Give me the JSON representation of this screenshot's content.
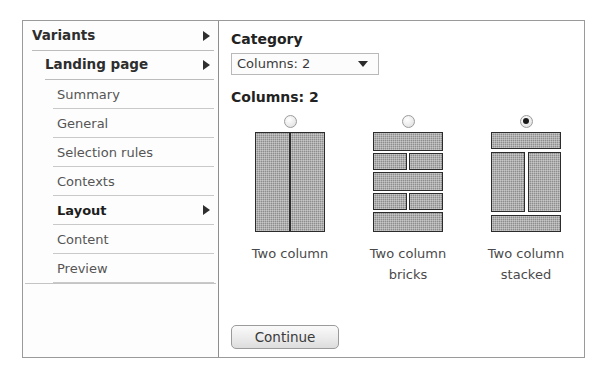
{
  "sidebar": {
    "items": [
      {
        "label": "Variants",
        "level": 0,
        "bold": true,
        "arrow": true,
        "selected": false
      },
      {
        "label": "Landing page",
        "level": 1,
        "bold": true,
        "arrow": true,
        "selected": false
      },
      {
        "label": "Summary",
        "level": 2,
        "bold": false,
        "arrow": false,
        "selected": false
      },
      {
        "label": "General",
        "level": 2,
        "bold": false,
        "arrow": false,
        "selected": false
      },
      {
        "label": "Selection rules",
        "level": 2,
        "bold": false,
        "arrow": false,
        "selected": false
      },
      {
        "label": "Contexts",
        "level": 2,
        "bold": false,
        "arrow": false,
        "selected": false
      },
      {
        "label": "Layout",
        "level": 2,
        "bold": true,
        "arrow": true,
        "selected": true
      },
      {
        "label": "Content",
        "level": 2,
        "bold": false,
        "arrow": false,
        "selected": false
      },
      {
        "label": "Preview",
        "level": 2,
        "bold": false,
        "arrow": false,
        "selected": false
      }
    ]
  },
  "content": {
    "category_title": "Category",
    "category_select": {
      "value": "Columns: 2",
      "arrow_icon": "chevron-down-icon"
    },
    "group_title": "Columns: 2",
    "options": [
      {
        "label": "Two column",
        "thumbnail": "two-column",
        "selected": false
      },
      {
        "label": "Two column bricks",
        "thumbnail": "two-column-bricks",
        "selected": false
      },
      {
        "label": "Two column stacked",
        "thumbnail": "two-column-stacked",
        "selected": true
      }
    ],
    "continue_label": "Continue"
  },
  "colors": {
    "frame_border": "#9a9a9a",
    "divider": "#8e8e8e",
    "block_fill": "#8d8d8d",
    "block_border": "#2c2c2c",
    "text": "#4a4a4a",
    "heading": "#222222"
  }
}
